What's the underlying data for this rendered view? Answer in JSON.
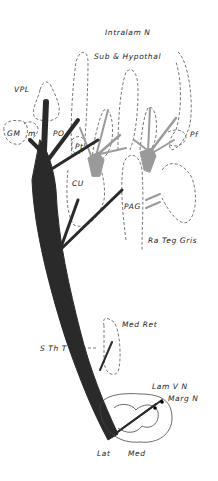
{
  "figure": {
    "type": "neuroanatomy-diagram",
    "colors": {
      "tract_dark": "#2a2a2a",
      "tract_gray": "#9a9a9a",
      "outline": "#555555"
    }
  },
  "labels": {
    "intralam": "Intralam N",
    "subhyp": "Sub & Hypothal",
    "vpl": "VPL",
    "gm": "GM",
    "m": "m",
    "po": "PO",
    "pt": "Pt",
    "pf": "Pf",
    "cu": "CU",
    "pag": "PAG",
    "ratg": "Ra Teg Gris",
    "medret": "Med Ret",
    "stht": "S Th T",
    "lam5": "Lam V N",
    "marg": "Marg N",
    "lat": "Lat",
    "med": "Med"
  }
}
